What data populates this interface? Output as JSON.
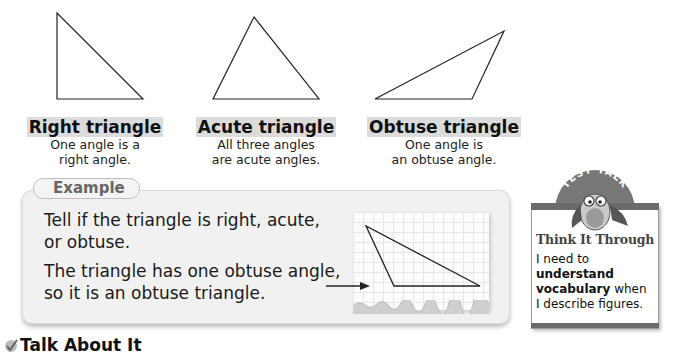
{
  "triangles": [
    {
      "name": "Right triangle",
      "desc_line1": "One angle is a",
      "desc_line2": "right angle."
    },
    {
      "name": "Acute triangle",
      "desc_line1": "All three angles",
      "desc_line2": "are acute angles."
    },
    {
      "name": "Obtuse triangle",
      "desc_line1": "One angle is",
      "desc_line2": "an obtuse angle."
    }
  ],
  "example": {
    "tab_label": "Example",
    "question_line1": "Tell if the triangle is right, acute,",
    "question_line2": "or obtuse.",
    "answer_line1": "The triangle has one obtuse angle,",
    "answer_line2": "so it is an obtuse triangle."
  },
  "test_talk": {
    "badge": "TEST TALK",
    "title": "Think It Through",
    "line1": "I need to",
    "line2_bold": "understand",
    "line3_bold": "vocabulary",
    "line3_rest": " when",
    "line4": "I describe figures."
  },
  "section": {
    "heading": "Talk About It",
    "icon": "check-icon"
  },
  "colors": {
    "highlight": "#dcdcdc",
    "panel": "#f1f1f1",
    "card_bar": "#6b6b6b"
  }
}
